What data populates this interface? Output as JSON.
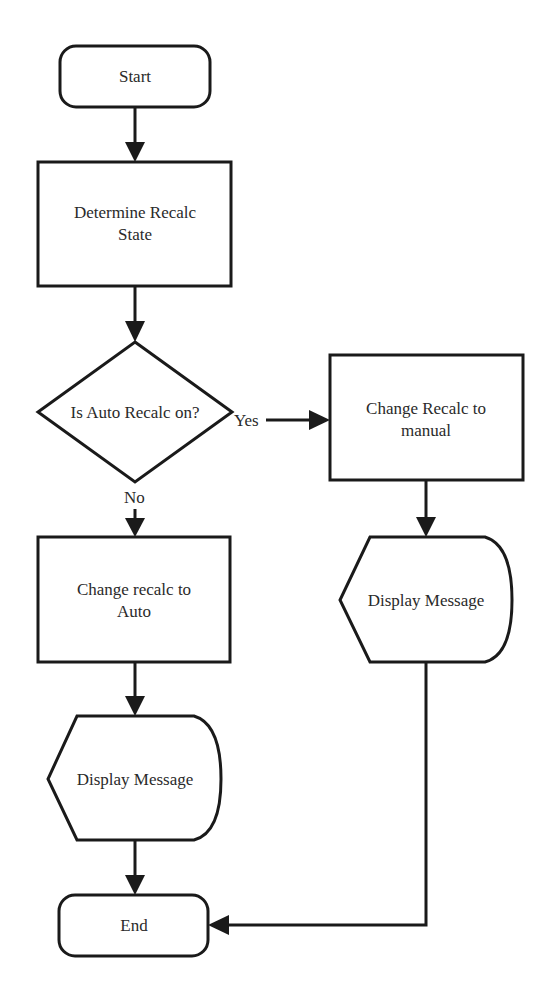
{
  "diagram": {
    "type": "flowchart",
    "nodes": {
      "start": {
        "shape": "terminator",
        "label": "Start"
      },
      "determine": {
        "shape": "process",
        "label_lines": [
          "Determine Recalc",
          "State"
        ]
      },
      "decision": {
        "shape": "decision",
        "label": "Is Auto Recalc on?"
      },
      "to_manual": {
        "shape": "process",
        "label_lines": [
          "Change Recalc to",
          "manual"
        ]
      },
      "display_right": {
        "shape": "display",
        "label": "Display Message"
      },
      "to_auto": {
        "shape": "process",
        "label_lines": [
          "Change recalc to",
          "Auto"
        ]
      },
      "display_left": {
        "shape": "display",
        "label": "Display Message"
      },
      "end": {
        "shape": "terminator",
        "label": "End"
      }
    },
    "edges": [
      {
        "from": "start",
        "to": "determine",
        "label": ""
      },
      {
        "from": "determine",
        "to": "decision",
        "label": ""
      },
      {
        "from": "decision",
        "to": "to_manual",
        "label": "Yes"
      },
      {
        "from": "decision",
        "to": "to_auto",
        "label": "No"
      },
      {
        "from": "to_manual",
        "to": "display_right",
        "label": ""
      },
      {
        "from": "to_auto",
        "to": "display_left",
        "label": ""
      },
      {
        "from": "display_left",
        "to": "end",
        "label": ""
      },
      {
        "from": "display_right",
        "to": "end",
        "label": ""
      }
    ],
    "edge_labels": {
      "yes": "Yes",
      "no": "No"
    }
  },
  "colors": {
    "stroke": "#1a1a1a",
    "text": "#2a2a2a",
    "background": "#ffffff"
  }
}
